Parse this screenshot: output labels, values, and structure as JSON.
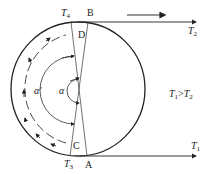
{
  "diagram": {
    "points": {
      "T4": {
        "sym": "T",
        "sub": "4"
      },
      "B": "B",
      "D": "D",
      "C": "C",
      "A": "A",
      "T3": {
        "sym": "T",
        "sub": "3"
      }
    },
    "angles": {
      "alpha": "α",
      "alpha_prime": "α'"
    },
    "outputs": {
      "T2": {
        "sym": "T",
        "sub": "2"
      },
      "T1": {
        "sym": "T",
        "sub": "1"
      }
    },
    "condition": {
      "a": "T",
      "a_sub": "1",
      "op": ">",
      "b": "T",
      "b_sub": "2"
    },
    "colors": {
      "stroke": "#222222",
      "arrow_gray": "#666666"
    }
  }
}
